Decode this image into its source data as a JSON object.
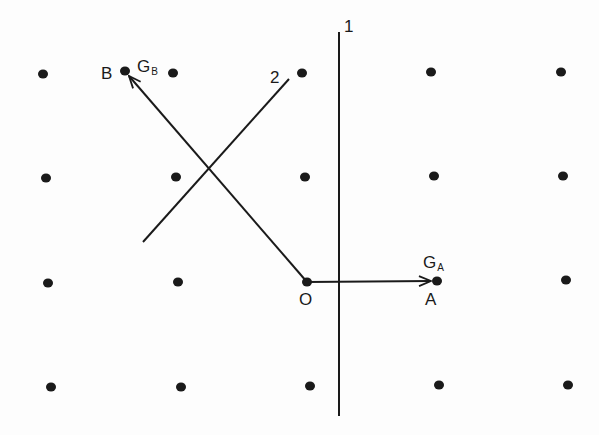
{
  "diagram": {
    "lattice_points": [
      {
        "x": 43,
        "y": 74
      },
      {
        "x": 173,
        "y": 73
      },
      {
        "x": 302,
        "y": 73
      },
      {
        "x": 431,
        "y": 72
      },
      {
        "x": 561,
        "y": 72
      },
      {
        "x": 46,
        "y": 178
      },
      {
        "x": 176,
        "y": 177
      },
      {
        "x": 305,
        "y": 177
      },
      {
        "x": 434,
        "y": 176
      },
      {
        "x": 563,
        "y": 176
      },
      {
        "x": 48,
        "y": 283
      },
      {
        "x": 178,
        "y": 282
      },
      {
        "x": 307,
        "y": 282
      },
      {
        "x": 437,
        "y": 281
      },
      {
        "x": 566,
        "y": 280
      },
      {
        "x": 51,
        "y": 387
      },
      {
        "x": 181,
        "y": 387
      },
      {
        "x": 310,
        "y": 386
      },
      {
        "x": 439,
        "y": 385
      },
      {
        "x": 568,
        "y": 385
      }
    ],
    "extra_points": [
      {
        "name": "B",
        "x": 125,
        "y": 71
      }
    ],
    "lines": [
      {
        "id": "line-1",
        "label": "1",
        "x1": 339,
        "y1": 32,
        "x2": 339,
        "y2": 416
      },
      {
        "id": "line-2",
        "label": "2",
        "x1": 143,
        "y1": 242,
        "x2": 289,
        "y2": 79
      }
    ],
    "vectors": [
      {
        "id": "vector-OA",
        "from": "O",
        "to": "A",
        "x1": 307,
        "y1": 282,
        "x2": 431,
        "y2": 281
      },
      {
        "id": "vector-OB",
        "from": "O",
        "to": "B",
        "x1": 307,
        "y1": 282,
        "x2": 129,
        "y2": 76
      }
    ],
    "labels": {
      "line1": "1",
      "line2": "2",
      "origin": "O",
      "pointA": "A",
      "pointB": "B",
      "gA_main": "G",
      "gA_sub": "A",
      "gB_main": "G",
      "gB_sub": "B"
    },
    "colors": {
      "ink": "#1a1a1a",
      "background": "#fdfdfd"
    }
  }
}
